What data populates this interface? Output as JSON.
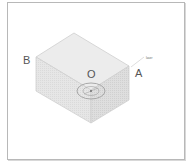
{
  "diagram": {
    "type": "isometric-box",
    "labels": {
      "A": "A",
      "B": "B",
      "O": "O",
      "tag": "laser"
    },
    "colors": {
      "top_face": "#ebebeb",
      "left_face": "#e4e4e4",
      "right_face": "#dcdcdc",
      "edge": "#c8c8c8",
      "frame": "#b8b8b8",
      "ellipse": "#9a9a9a"
    }
  }
}
